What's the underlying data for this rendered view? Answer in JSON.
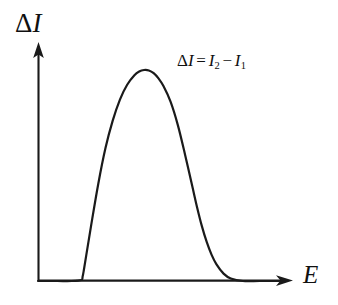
{
  "figure": {
    "background_color": "#ffffff",
    "ink_color": "#1a1a1a",
    "y_axis": {
      "label_delta": "Δ",
      "label_symbol": "I",
      "label_full": "ΔI",
      "has_arrowhead": true
    },
    "x_axis": {
      "label_symbol": "E",
      "label_full": "E",
      "has_arrowhead": true
    },
    "annotation": {
      "lhs_delta": "Δ",
      "lhs_symbol": "I",
      "equals": "=",
      "term1_symbol": "I",
      "term1_subscript": "2",
      "minus": "−",
      "term2_symbol": "I",
      "term2_subscript": "1",
      "full_text": "ΔI = I₂ − I₁"
    }
  },
  "chart_data": {
    "type": "line",
    "title": "",
    "subtitle": "",
    "xlabel": "E",
    "ylabel": "ΔI",
    "grid": false,
    "legend": null,
    "annotations": [
      {
        "text": "ΔI = I₂ − I₁",
        "x_px": 215,
        "y_px": 66
      }
    ],
    "axis_ticks": {
      "x": [],
      "y": []
    },
    "xlim": [
      0,
      1
    ],
    "ylim": [
      0,
      1
    ],
    "series": [
      {
        "name": "delta-I peak",
        "description": "single asymmetric bell-shaped peak, zero baseline on both sides",
        "x": [
          0.0,
          0.08,
          0.14,
          0.18,
          0.185,
          0.19,
          0.2,
          0.22,
          0.25,
          0.28,
          0.31,
          0.34,
          0.37,
          0.4,
          0.42,
          0.44,
          0.46,
          0.48,
          0.5,
          0.52,
          0.55,
          0.58,
          0.61,
          0.64,
          0.66,
          0.68,
          0.7,
          0.72,
          0.74,
          0.77,
          0.8,
          0.85,
          0.92,
          1.0
        ],
        "y": [
          0.0,
          0.0,
          0.0,
          0.005,
          0.02,
          0.05,
          0.12,
          0.26,
          0.46,
          0.63,
          0.76,
          0.86,
          0.93,
          0.975,
          0.993,
          1.0,
          0.998,
          0.985,
          0.96,
          0.925,
          0.85,
          0.74,
          0.6,
          0.45,
          0.35,
          0.26,
          0.185,
          0.125,
          0.08,
          0.035,
          0.012,
          0.0,
          0.0,
          0.0
        ],
        "peak_x": 0.44,
        "peak_y": 1.0,
        "left_foot_x": 0.185,
        "right_foot_x": 0.815
      }
    ],
    "geometry_px": {
      "origin": [
        38,
        281
      ],
      "y_axis_top": [
        38,
        45
      ],
      "x_axis_right": [
        292,
        281
      ],
      "peak_apex": [
        150,
        70
      ],
      "left_foot": [
        85,
        281
      ],
      "right_foot": [
        208,
        281
      ]
    }
  }
}
